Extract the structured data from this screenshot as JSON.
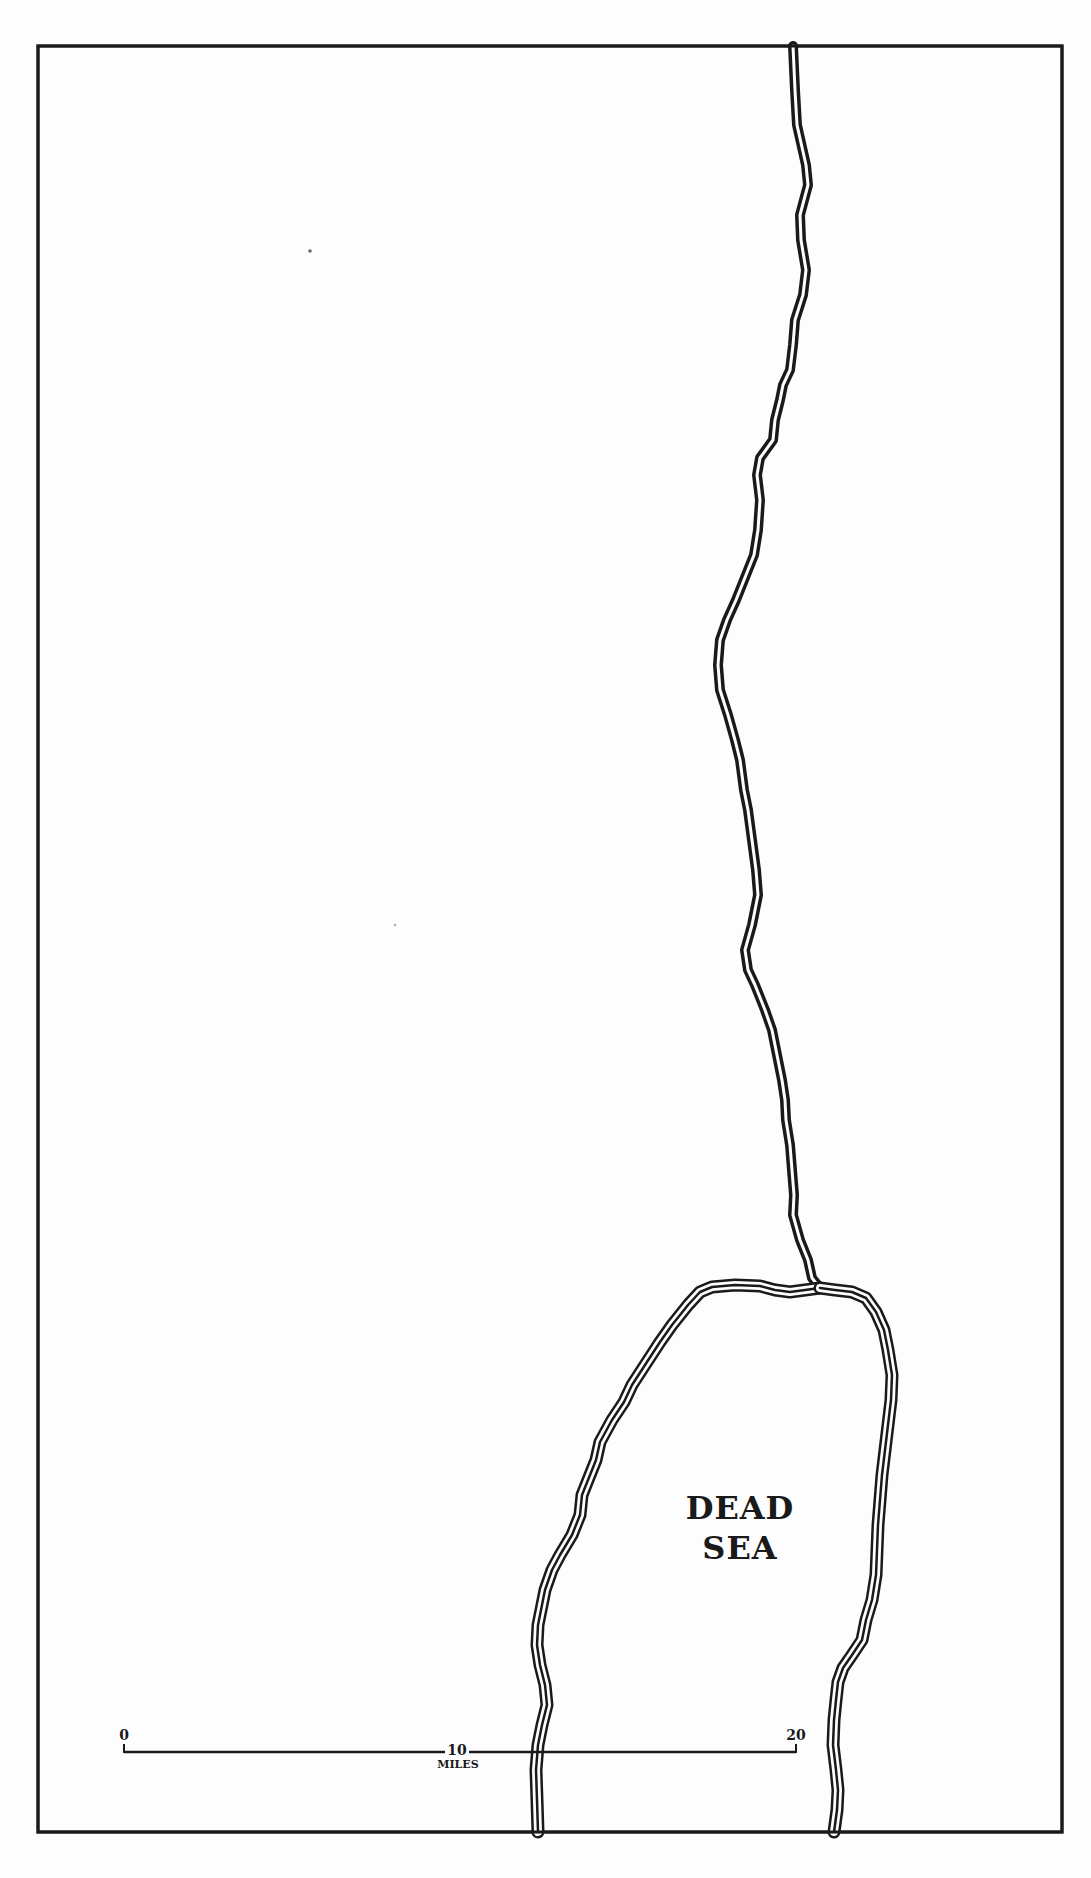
{
  "map": {
    "labels": {
      "sea_line1": "DEAD",
      "sea_line2": "SEA"
    },
    "scale_bar": {
      "ticks": [
        "0",
        "10",
        "20"
      ],
      "unit": "MILES"
    },
    "colors": {
      "background": "#fdfdfd",
      "ink": "#1a1a1a"
    }
  }
}
